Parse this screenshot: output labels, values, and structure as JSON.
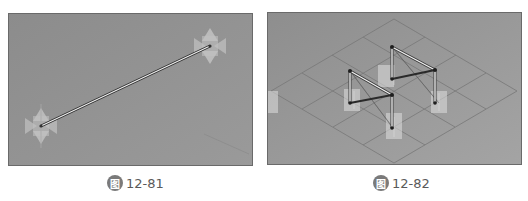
{
  "figures": [
    {
      "id": "left",
      "caption_badge": "图",
      "caption_number": "12-81",
      "description": "Single line between two points in a 3D viewport",
      "background": "#8e8e8e"
    },
    {
      "id": "right",
      "caption_badge": "图",
      "caption_number": "12-82",
      "description": "Isometric grid with frame of line members on two columns",
      "background": "#969696"
    }
  ],
  "colors": {
    "panel_border": "#6a6a6a",
    "line_light": "#e8e8e8",
    "line_dark": "#303030",
    "grid": "#7a7a7a",
    "gizmo": "#d6d6d6"
  }
}
